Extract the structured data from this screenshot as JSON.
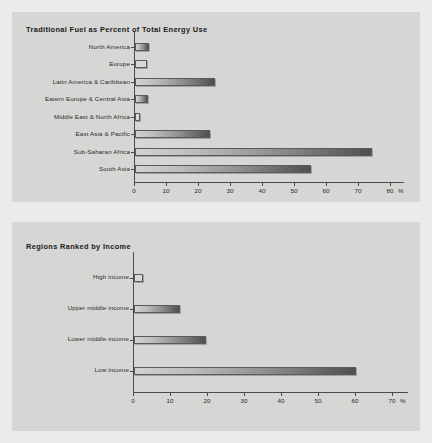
{
  "page": {
    "background_color": "#eaeae8",
    "panel_color": "#d6d6d4"
  },
  "chart_data": [
    {
      "type": "bar",
      "orientation": "horizontal",
      "title": "Traditional Fuel as Percent of Total Energy Use",
      "xlabel": "%",
      "ylabel": "",
      "xlim": [
        0,
        80
      ],
      "xticks": [
        0,
        10,
        20,
        30,
        40,
        50,
        60,
        70,
        80
      ],
      "axis_unit": "%",
      "grid": false,
      "legend": false,
      "categories": [
        "North America",
        "Europe",
        "Latin America & Caribbean",
        "Eatern Europe & Central Asia",
        "Middle East & North Africa",
        "East Asia & Pacific",
        "Sub-Saharan Africa",
        "South Asia"
      ],
      "values": [
        4.5,
        3.7,
        25,
        4,
        1.5,
        23.5,
        74,
        55
      ]
    },
    {
      "type": "bar",
      "orientation": "horizontal",
      "title": "Regions Ranked by Income",
      "xlabel": "%",
      "ylabel": "",
      "xlim": [
        0,
        70
      ],
      "xticks": [
        0,
        10,
        20,
        30,
        40,
        50,
        60,
        70
      ],
      "axis_unit": "%",
      "grid": false,
      "legend": false,
      "categories": [
        "High income",
        "Upper middle income",
        "Lower middle income",
        "Low income"
      ],
      "values": [
        2.5,
        12.5,
        19.5,
        60
      ]
    }
  ]
}
